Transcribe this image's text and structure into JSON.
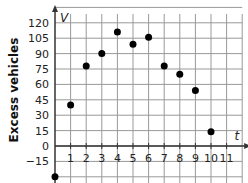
{
  "chart_data": {
    "type": "scatter",
    "title": "",
    "xlabel": "t",
    "ylabel": "Excess vehicles",
    "y_axis_name": "V",
    "x_ticks": [
      1,
      2,
      3,
      4,
      5,
      6,
      7,
      8,
      9,
      10,
      11
    ],
    "y_ticks": [
      120,
      105,
      90,
      75,
      60,
      45,
      30,
      15,
      0,
      -15
    ],
    "xlim": [
      0,
      12
    ],
    "ylim": [
      -30,
      135
    ],
    "grid": true,
    "series": [
      {
        "name": "V",
        "x": [
          0,
          1,
          2,
          3,
          4,
          5,
          6,
          7,
          8,
          9,
          10
        ],
        "y": [
          -30,
          40,
          78,
          90,
          111,
          99,
          106,
          78,
          70,
          54,
          14
        ]
      }
    ]
  },
  "colors": {
    "grid": "#999999",
    "axis": "#333333",
    "point": "#000000"
  }
}
